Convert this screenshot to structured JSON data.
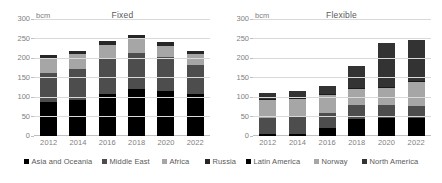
{
  "legend": {
    "items": [
      {
        "label": "Asia and Oceania",
        "color": "#000000",
        "x": 24
      },
      {
        "label": "Middle East",
        "color": "#4d4d4d",
        "x": 102
      },
      {
        "label": "Africa",
        "color": "#a6a6a6",
        "x": 162
      },
      {
        "label": "Russia",
        "color": "#262626",
        "x": 205
      },
      {
        "label": "Latin America",
        "color": "#000000",
        "x": 246
      },
      {
        "label": "Norway",
        "color": "#a6a6a6",
        "x": 314
      },
      {
        "label": "North America",
        "color": "#333333",
        "x": 362
      }
    ]
  },
  "chart_data": [
    {
      "type": "bar",
      "stacked": true,
      "title": "Fixed",
      "unit_label": "bcm",
      "xlabel": "",
      "ylabel": "bcm",
      "ylim": [
        0,
        300
      ],
      "yticks": [
        0,
        50,
        100,
        150,
        200,
        250,
        300
      ],
      "ytick_labels": [
        "0",
        "50",
        "100",
        "150",
        "200",
        "250",
        "300"
      ],
      "grid": true,
      "legend_position": "bottom",
      "categories": [
        "2012",
        "2014",
        "2016",
        "2018",
        "2020",
        "2022"
      ],
      "series": [
        {
          "name": "Asia and Oceania",
          "color": "#000000",
          "values": [
            88,
            93,
            107,
            120,
            115,
            107
          ]
        },
        {
          "name": "Middle East",
          "color": "#4d4d4d",
          "values": [
            74,
            79,
            90,
            93,
            87,
            74
          ]
        },
        {
          "name": "Africa",
          "color": "#a6a6a6",
          "values": [
            38,
            38,
            36,
            37,
            30,
            29
          ]
        },
        {
          "name": "Russia",
          "color": "#262626",
          "values": [
            7,
            8,
            10,
            8,
            9,
            8
          ]
        }
      ],
      "totals": [
        207,
        218,
        243,
        258,
        241,
        218
      ]
    },
    {
      "type": "bar",
      "stacked": true,
      "title": "Flexible",
      "unit_label": "bcm",
      "xlabel": "",
      "ylabel": "bcm",
      "ylim": [
        0,
        300
      ],
      "yticks": [
        0,
        50,
        100,
        150,
        200,
        250,
        300
      ],
      "ytick_labels": [
        "0",
        "50",
        "100",
        "150",
        "200",
        "250",
        "300"
      ],
      "grid": true,
      "legend_position": "bottom",
      "categories": [
        "2012",
        "2014",
        "2016",
        "2018",
        "2020",
        "2022"
      ],
      "series": [
        {
          "name": "Russia",
          "color": "#000000",
          "values": [
            4,
            5,
            20,
            43,
            46,
            46
          ]
        },
        {
          "name": "Latin America",
          "color": "#4d4d4d",
          "values": [
            43,
            43,
            39,
            36,
            34,
            32
          ]
        },
        {
          "name": "Norway",
          "color": "#a6a6a6",
          "values": [
            45,
            46,
            45,
            42,
            42,
            60
          ]
        },
        {
          "name": "Russia 2",
          "color": "#1a1a1a",
          "values": [
            3,
            3,
            4,
            3,
            4,
            3
          ]
        },
        {
          "name": "North America",
          "color": "#333333",
          "values": [
            16,
            18,
            19,
            56,
            112,
            104
          ]
        }
      ],
      "totals": [
        111,
        115,
        127,
        180,
        238,
        245
      ]
    }
  ]
}
